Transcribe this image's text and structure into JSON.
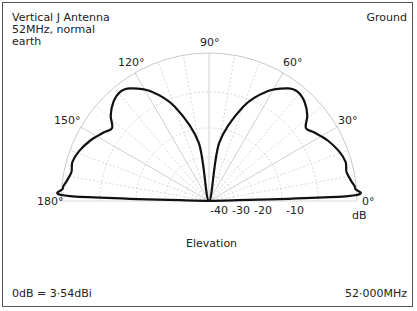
{
  "title": {
    "line1": "Vertical J Antenna",
    "line2": "52MHz, normal",
    "line3": "earth"
  },
  "mode_label": "Ground",
  "footer": {
    "reference": "0dB = 3·54dBi",
    "frequency": "52·000MHz"
  },
  "axis": {
    "elevation_label": "Elevation",
    "db_unit": "dB",
    "angle_labels": [
      "0°",
      "30°",
      "60°",
      "90°",
      "120°",
      "150°",
      "180°"
    ],
    "db_ticks": [
      "-40",
      "-30",
      "-20",
      "-10"
    ]
  },
  "chart_data": {
    "type": "polar",
    "subtitle": "Ground",
    "xlabel": "Elevation",
    "ylabel": "dB",
    "theta_range": [
      0,
      180
    ],
    "theta_ticks": [
      0,
      30,
      60,
      90,
      120,
      150,
      180
    ],
    "r_ticks": [
      -40,
      -30,
      -20,
      -10,
      0
    ],
    "r_range": [
      -50,
      0
    ],
    "grid": true,
    "reference": "0dB = 3.54dBi",
    "frequency_MHz": 52.0,
    "series": [
      {
        "name": "Elevation pattern",
        "points_deg_db": [
          [
            0,
            -50
          ],
          [
            2,
            -3
          ],
          [
            5,
            -0.5
          ],
          [
            8,
            -1.5
          ],
          [
            12,
            -2.5
          ],
          [
            16,
            -2
          ],
          [
            21,
            -3
          ],
          [
            27,
            -5
          ],
          [
            33,
            -7.5
          ],
          [
            37,
            -9
          ],
          [
            41,
            -6
          ],
          [
            46,
            -3.5
          ],
          [
            51,
            -2.5
          ],
          [
            55,
            -3.5
          ],
          [
            62,
            -8
          ],
          [
            70,
            -16
          ],
          [
            80,
            -30
          ],
          [
            90,
            -50
          ],
          [
            100,
            -30
          ],
          [
            110,
            -16
          ],
          [
            118,
            -8
          ],
          [
            125,
            -3.5
          ],
          [
            129,
            -2.5
          ],
          [
            134,
            -3.5
          ],
          [
            139,
            -6
          ],
          [
            143,
            -9
          ],
          [
            147,
            -7.5
          ],
          [
            153,
            -5
          ],
          [
            159,
            -3
          ],
          [
            164,
            -2
          ],
          [
            168,
            -2.5
          ],
          [
            172,
            -1.5
          ],
          [
            175,
            -0.5
          ],
          [
            178,
            -3
          ],
          [
            180,
            -50
          ]
        ]
      }
    ]
  }
}
